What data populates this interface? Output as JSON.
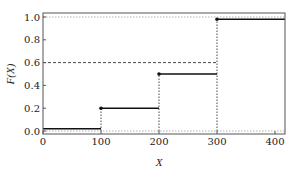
{
  "chart_data": {
    "type": "line",
    "subtype": "step-cdf",
    "title": "",
    "xlabel": "X",
    "ylabel": "F(X)",
    "xlim": [
      0,
      420
    ],
    "ylim": [
      -0.02,
      1.04
    ],
    "xticks": [
      0,
      100,
      200,
      300,
      400
    ],
    "xtick_labels": [
      "0",
      "100",
      "200",
      "300",
      "400"
    ],
    "yticks": [
      0.0,
      0.2,
      0.4,
      0.6,
      0.8,
      1.0
    ],
    "ytick_labels": [
      "0.0",
      "0.2",
      "0.4",
      "0.6",
      "0.8",
      "1.0"
    ],
    "grid": false,
    "legend": null,
    "series": [
      {
        "name": "F(X)",
        "style": "solid-step",
        "color": "#111111",
        "steps": [
          {
            "x_start": 0,
            "x_end": 100,
            "y": 0.02
          },
          {
            "x_start": 100,
            "x_end": 200,
            "y": 0.2
          },
          {
            "x_start": 200,
            "x_end": 300,
            "y": 0.5
          },
          {
            "x_start": 300,
            "x_end": 420,
            "y": 0.98
          }
        ],
        "points": [
          {
            "x": 100,
            "y": 0.2
          },
          {
            "x": 200,
            "y": 0.5
          },
          {
            "x": 300,
            "y": 0.98
          }
        ]
      }
    ],
    "reference_lines": [
      {
        "orientation": "horizontal",
        "y": 0.0,
        "style": "dotted",
        "color": "#aaaaaa",
        "x_start": 0,
        "x_end": 420
      },
      {
        "orientation": "horizontal",
        "y": 1.0,
        "style": "dotted",
        "color": "#aaaaaa",
        "x_start": 0,
        "x_end": 420
      },
      {
        "orientation": "horizontal",
        "y": 0.6,
        "style": "dashed",
        "color": "#333333",
        "x_start": 0,
        "x_end": 300
      },
      {
        "orientation": "vertical",
        "x": 100,
        "style": "dotted",
        "color": "#333333",
        "y_start": 0.0,
        "y_end": 0.2
      },
      {
        "orientation": "vertical",
        "x": 200,
        "style": "dotted",
        "color": "#333333",
        "y_start": 0.0,
        "y_end": 0.5
      },
      {
        "orientation": "vertical",
        "x": 300,
        "style": "dotted",
        "color": "#333333",
        "y_start": 0.0,
        "y_end": 0.98
      }
    ]
  }
}
